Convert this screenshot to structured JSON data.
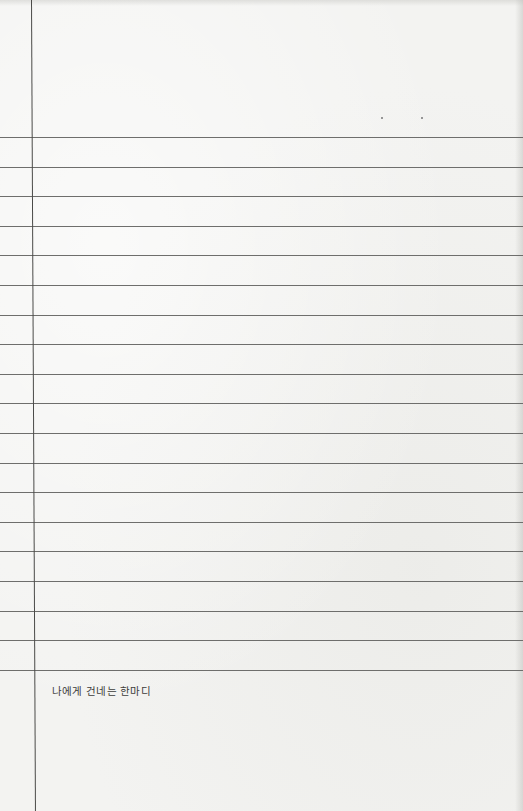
{
  "page": {
    "type": "lined-notebook-page",
    "background_color": "#f3f3f1",
    "rule_color": "#6e6e6c",
    "margin_color": "#4a4a48"
  },
  "rules": {
    "count": 19,
    "first_y": 137,
    "spacing": 29.6
  },
  "caption": {
    "text": "나에게 건네는 한마디"
  }
}
